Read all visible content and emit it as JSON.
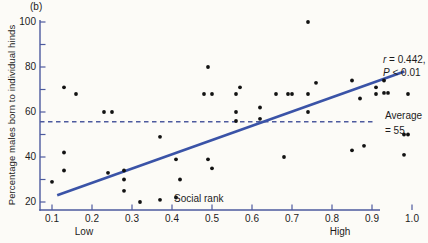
{
  "figure": {
    "panel_label": "(b)",
    "y_axis": {
      "label": "Percentage males born to individual hinds",
      "tick_values": [
        100,
        90,
        80,
        70,
        60,
        50,
        40,
        30,
        20
      ],
      "labeled_ticks": [
        {
          "value": 100,
          "label": "100"
        },
        {
          "value": 80,
          "label": "80"
        },
        {
          "value": 60,
          "label": "60"
        },
        {
          "value": 40,
          "label": "40"
        },
        {
          "value": 20,
          "label": "20"
        }
      ]
    },
    "x_axis": {
      "label": "Social rank",
      "ticks": [
        {
          "value": 0.1,
          "label": "0.1"
        },
        {
          "value": 0.2,
          "label": "0.2"
        },
        {
          "value": 0.3,
          "label": "0.3"
        },
        {
          "value": 0.4,
          "label": "0.4"
        },
        {
          "value": 0.5,
          "label": "0.5"
        },
        {
          "value": 0.6,
          "label": "0.6"
        },
        {
          "value": 0.7,
          "label": "0.7"
        },
        {
          "value": 0.8,
          "label": "0.8"
        },
        {
          "value": 0.9,
          "label": "0.9"
        },
        {
          "value": 1.0,
          "label": "1.0"
        }
      ],
      "end_label_low": "Low",
      "end_label_high": "High"
    },
    "annotations": {
      "r_var": "r",
      "r_rest": " = 0.442,",
      "p_var": "P",
      "p_rest": " < 0.01",
      "average_line1": "Average",
      "average_line2": "= 55"
    },
    "colors": {
      "axis": "#4d5a9e",
      "trend": "#3a53a7",
      "dashed": "#4d5a9e",
      "dot": "#121212",
      "text": "#1c1c1c",
      "background": "#fcfbf7"
    }
  },
  "chart_data": {
    "type": "scatter",
    "title": "",
    "xlabel": "Social rank",
    "ylabel": "Percentage males born to individual hinds",
    "xlim": [
      0.1,
      1.0
    ],
    "ylim": [
      20,
      100
    ],
    "grid": false,
    "stats": {
      "r": 0.442,
      "p": "< 0.01"
    },
    "average_line": {
      "y": 55,
      "label": "Average = 55"
    },
    "trendline": {
      "x1": 0.113,
      "y1": 23,
      "x2": 0.981,
      "y2": 78
    },
    "points": [
      [
        0.1,
        29
      ],
      [
        0.13,
        42
      ],
      [
        0.13,
        34
      ],
      [
        0.13,
        71
      ],
      [
        0.16,
        68
      ],
      [
        0.23,
        60
      ],
      [
        0.25,
        60
      ],
      [
        0.24,
        33
      ],
      [
        0.28,
        34
      ],
      [
        0.28,
        30
      ],
      [
        0.28,
        25
      ],
      [
        0.32,
        20
      ],
      [
        0.37,
        21
      ],
      [
        0.37,
        49
      ],
      [
        0.41,
        39
      ],
      [
        0.42,
        30
      ],
      [
        0.41,
        22
      ],
      [
        0.49,
        80
      ],
      [
        0.48,
        68
      ],
      [
        0.5,
        68
      ],
      [
        0.49,
        39
      ],
      [
        0.5,
        35
      ],
      [
        0.56,
        68
      ],
      [
        0.57,
        71
      ],
      [
        0.56,
        60
      ],
      [
        0.56,
        56
      ],
      [
        0.62,
        62
      ],
      [
        0.62,
        57
      ],
      [
        0.66,
        68
      ],
      [
        0.68,
        40
      ],
      [
        0.69,
        68
      ],
      [
        0.7,
        68
      ],
      [
        0.74,
        68
      ],
      [
        0.74,
        60
      ],
      [
        0.74,
        100
      ],
      [
        0.76,
        73
      ],
      [
        0.85,
        74
      ],
      [
        0.85,
        43
      ],
      [
        0.88,
        45
      ],
      [
        0.87,
        66
      ],
      [
        0.91,
        71
      ],
      [
        0.91,
        68
      ],
      [
        0.93,
        74
      ],
      [
        0.93,
        68.5
      ],
      [
        0.94,
        68.5
      ],
      [
        0.98,
        50
      ],
      [
        0.99,
        50
      ],
      [
        0.98,
        41
      ],
      [
        0.99,
        68
      ]
    ]
  }
}
